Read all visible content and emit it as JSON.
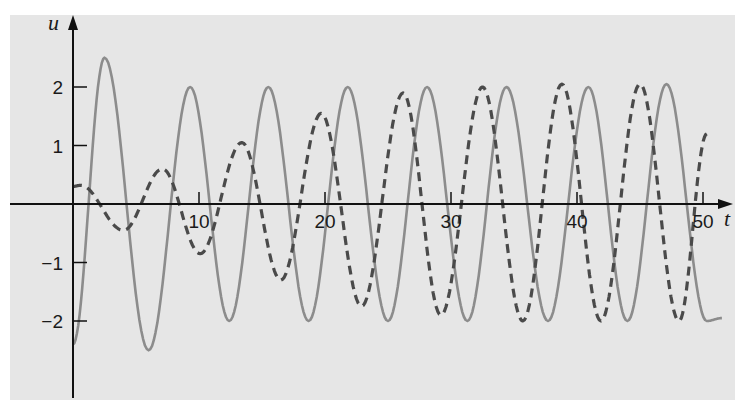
{
  "chart_data": {
    "type": "line",
    "title": "",
    "xlabel": "t",
    "ylabel": "u",
    "xlim": [
      0,
      52
    ],
    "ylim": [
      -3,
      2.9
    ],
    "grid": false,
    "legend": null,
    "x_ticks": [
      10,
      20,
      30,
      40,
      50
    ],
    "x_tick_labels": [
      "10",
      "20",
      "30",
      "40",
      "50"
    ],
    "y_ticks": [
      -2,
      -1,
      1,
      2
    ],
    "y_tick_labels": [
      "-2",
      "-1",
      "1",
      "2"
    ],
    "series": [
      {
        "name": "solid",
        "style": "solid",
        "color": "#8c8c8c",
        "extrema_t": [
          0,
          2.5,
          6.0,
          9.3,
          12.4,
          15.5,
          18.7,
          21.8,
          25.0,
          28.1,
          31.3,
          34.4,
          37.7,
          40.9,
          44.0,
          47.1,
          50.3,
          51.5
        ],
        "extrema_u": [
          -2.4,
          2.5,
          -2.5,
          2.0,
          -2.0,
          2.0,
          -2.0,
          2.0,
          -2.0,
          2.0,
          -2.0,
          2.0,
          -2.0,
          2.0,
          -2.0,
          2.05,
          -2.0,
          -1.95
        ]
      },
      {
        "name": "dashed",
        "style": "dashed",
        "color": "#4a4a4a",
        "extrema_t": [
          0,
          0.6,
          4.0,
          7.1,
          10.1,
          13.4,
          16.5,
          19.7,
          22.9,
          26.2,
          29.2,
          32.5,
          35.7,
          38.8,
          41.9,
          45.0,
          48.1,
          50.3
        ],
        "extrema_u": [
          0.3,
          0.32,
          -0.45,
          0.6,
          -0.85,
          1.05,
          -1.3,
          1.55,
          -1.75,
          1.9,
          -1.9,
          2.0,
          -2.0,
          2.05,
          -2.0,
          2.05,
          -2.0,
          1.2
        ]
      }
    ]
  }
}
